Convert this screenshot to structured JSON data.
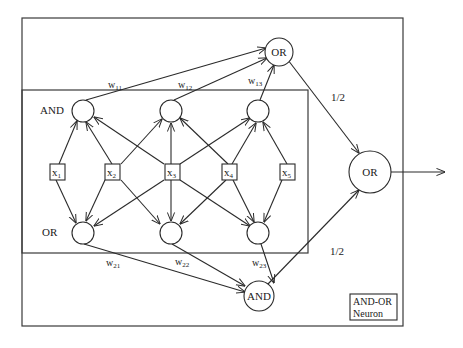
{
  "diagram": {
    "title": "AND-OR Neuron",
    "legend": {
      "line1": "AND-OR",
      "line2": "Neuron"
    },
    "inputs": [
      {
        "id": "x1",
        "label": "x",
        "sub": "1"
      },
      {
        "id": "x2",
        "label": "x",
        "sub": "2"
      },
      {
        "id": "x3",
        "label": "x",
        "sub": "3"
      },
      {
        "id": "x4",
        "label": "x",
        "sub": "4"
      },
      {
        "id": "x5",
        "label": "x",
        "sub": "5"
      }
    ],
    "layers": {
      "and_layer_label": "AND",
      "or_layer_label": "OR"
    },
    "hidden_nodes": {
      "top_or": "OR",
      "bottom_and": "AND",
      "output_or": "OR"
    },
    "weights": {
      "w11": {
        "base": "w",
        "sub": "11"
      },
      "w12": {
        "base": "w",
        "sub": "12"
      },
      "w13": {
        "base": "w",
        "sub": "13"
      },
      "w21": {
        "base": "w",
        "sub": "21"
      },
      "w22": {
        "base": "w",
        "sub": "22"
      },
      "w23": {
        "base": "w",
        "sub": "23"
      }
    },
    "output_weights": {
      "top": "1/2",
      "bottom": "1/2"
    }
  }
}
